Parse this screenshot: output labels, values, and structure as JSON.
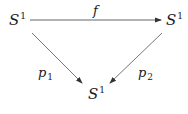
{
  "diagram": {
    "type": "commutative-triangle",
    "nodes": [
      {
        "id": "top-left",
        "base": "S",
        "sup": "1"
      },
      {
        "id": "top-right",
        "base": "S",
        "sup": "1"
      },
      {
        "id": "bottom",
        "base": "S",
        "sup": "1"
      }
    ],
    "edges": [
      {
        "from": "top-left",
        "to": "top-right",
        "label_base": "f",
        "label_sub": ""
      },
      {
        "from": "top-left",
        "to": "bottom",
        "label_base": "p",
        "label_sub": "1"
      },
      {
        "from": "top-right",
        "to": "bottom",
        "label_base": "p",
        "label_sub": "2"
      }
    ],
    "colors": {
      "stroke": "#555555",
      "text": "#1a1a1a"
    }
  }
}
